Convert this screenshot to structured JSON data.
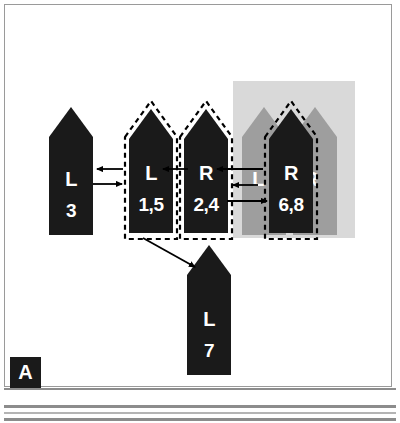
{
  "figure": {
    "panel_label": "A",
    "background_color": "#ffffff",
    "frame_color": "#9a9a9a",
    "shape_fill_active": "#1a1a1a",
    "shape_fill_inactive": "#9e9e9e",
    "highlight_box_color": "#d9d9d9",
    "label_color": "#ffffff",
    "arrow_color": "#000000",
    "dash_outline_color": "#000000"
  },
  "shapes": [
    {
      "id": "shape-l3",
      "letter": "L",
      "number": "3",
      "state": "active",
      "outlined": false,
      "fill": "#1a1a1a"
    },
    {
      "id": "shape-l15",
      "letter": "L",
      "number": "1,5",
      "state": "active",
      "outlined": true,
      "fill": "#1a1a1a"
    },
    {
      "id": "shape-r24",
      "letter": "R",
      "number": "2,4",
      "state": "active",
      "outlined": true,
      "fill": "#1a1a1a"
    },
    {
      "id": "shape-l-gray",
      "letter": "L",
      "number": "",
      "state": "inactive",
      "outlined": false,
      "fill": "#9e9e9e"
    },
    {
      "id": "shape-r68",
      "letter": "R",
      "number": "6,8",
      "state": "active",
      "outlined": true,
      "fill": "#1a1a1a"
    },
    {
      "id": "shape-r-gray",
      "letter": "R",
      "number": "",
      "state": "inactive",
      "outlined": false,
      "fill": "#9e9e9e"
    },
    {
      "id": "shape-l7",
      "letter": "L",
      "number": "7",
      "state": "active",
      "outlined": false,
      "fill": "#1a1a1a"
    }
  ],
  "arrows": [
    {
      "id": "arrow-l15-to-l3",
      "direction": "left",
      "from": "shape-l15",
      "to": "shape-l3"
    },
    {
      "id": "arrow-l3-to-l15",
      "direction": "right",
      "from": "shape-l3",
      "to": "shape-l15"
    },
    {
      "id": "arrow-r24-to-l15",
      "direction": "left",
      "from": "shape-r24",
      "to": "shape-l15"
    },
    {
      "id": "arrow-r68-to-r24",
      "direction": "left",
      "from": "shape-r68",
      "to": "shape-r24"
    },
    {
      "id": "arrow-lgray-to-r24",
      "direction": "left",
      "from": "shape-l-gray",
      "to": "shape-r24"
    },
    {
      "id": "arrow-r24-to-r68",
      "direction": "right",
      "from": "shape-r24",
      "to": "shape-r68"
    },
    {
      "id": "arrow-l15-to-l7",
      "direction": "diagonal-down-right",
      "from": "shape-l15",
      "to": "shape-l7"
    }
  ]
}
